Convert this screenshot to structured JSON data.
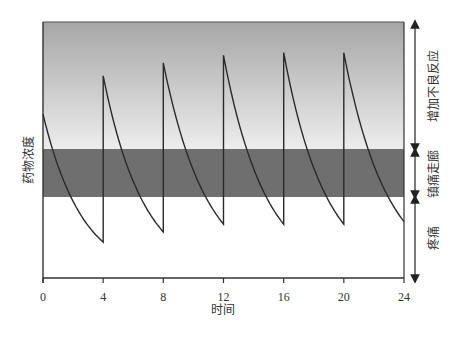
{
  "chart_data": {
    "type": "line",
    "title": "",
    "xlabel": "时间",
    "ylabel": "药物浓度",
    "x_ticks": [
      0,
      4,
      8,
      12,
      16,
      20,
      24
    ],
    "xlim": [
      0,
      24
    ],
    "ylim": [
      0,
      100
    ],
    "grid": false,
    "legend": null,
    "zones": [
      {
        "name": "增加不良反应",
        "y_from": 46,
        "y_to": 100,
        "fill": "gradient #a8a8a8→#ececec"
      },
      {
        "name": "镇痛走廊",
        "y_from": 32,
        "y_to": 46,
        "fill": "#6f6f6f"
      },
      {
        "name": "疼痛",
        "y_from": 0,
        "y_to": 32,
        "fill": "#ffffff"
      }
    ],
    "dose_times": [
      0,
      4,
      8,
      12,
      16,
      20
    ],
    "series": [
      {
        "name": "药物浓度",
        "segments": [
          {
            "t_start": 0,
            "t_end": 4,
            "peak": 64,
            "trough": 14
          },
          {
            "t_start": 4,
            "t_end": 8,
            "peak": 79,
            "trough": 18
          },
          {
            "t_start": 8,
            "t_end": 12,
            "peak": 84,
            "trough": 21
          },
          {
            "t_start": 12,
            "t_end": 16,
            "peak": 87,
            "trough": 21
          },
          {
            "t_start": 16,
            "t_end": 20,
            "peak": 88,
            "trough": 21
          },
          {
            "t_start": 20,
            "t_end": 24,
            "peak": 88,
            "trough": 22
          }
        ]
      }
    ]
  },
  "labels": {
    "ylabel": "药物浓度",
    "xlabel": "时间",
    "zone_adverse": "增加不良反应",
    "zone_corridor": "镇痛走廊",
    "zone_pain": "疼痛",
    "ticks": [
      "0",
      "4",
      "8",
      "12",
      "16",
      "20",
      "24"
    ]
  },
  "colors": {
    "gradient_top": "#a6a6a6",
    "gradient_bottom": "#ededed",
    "corridor": "#6f6f6f",
    "curve": "#2a2a2a",
    "axis": "#333333"
  }
}
